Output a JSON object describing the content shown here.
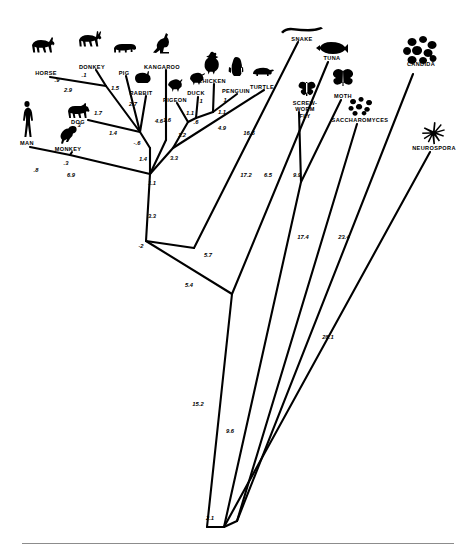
{
  "figure": {
    "type": "phylogenetic-tree"
  },
  "taxa": [
    {
      "name": "HORSE",
      "label": "HORSE",
      "icon": "horse-icon",
      "lx": 46,
      "ly": 70,
      "gx": 46,
      "gy": 36
    },
    {
      "name": "DONKEY",
      "label": "DONKEY",
      "icon": "donkey-icon",
      "lx": 92,
      "ly": 64,
      "gx": 92,
      "gy": 31
    },
    {
      "name": "PIG",
      "label": "PIG",
      "icon": "pig-icon",
      "lx": 124,
      "ly": 70,
      "gx": 125,
      "gy": 42
    },
    {
      "name": "KANGAROO",
      "label": "KANGAROO",
      "icon": "kangaroo-icon",
      "lx": 162,
      "ly": 64,
      "gx": 163,
      "gy": 32
    },
    {
      "name": "RABBIT",
      "label": "RABBIT",
      "icon": "rabbit-icon",
      "lx": 141,
      "ly": 90,
      "gx": 142,
      "gy": 70
    },
    {
      "name": "PIGEON",
      "label": "PIGEON",
      "icon": "pigeon-icon",
      "lx": 175,
      "ly": 97,
      "gx": 175,
      "gy": 78
    },
    {
      "name": "DUCK",
      "label": "DUCK",
      "icon": "duck-icon",
      "lx": 196,
      "ly": 90,
      "gx": 197,
      "gy": 71
    },
    {
      "name": "CHICKEN",
      "label": "CHICKEN",
      "icon": "chicken-icon",
      "lx": 212,
      "ly": 78,
      "gx": 212,
      "gy": 51
    },
    {
      "name": "PENGUIN",
      "label": "PENGUIN",
      "icon": "penguin-icon",
      "lx": 236,
      "ly": 88,
      "gx": 236,
      "gy": 56
    },
    {
      "name": "TURTLE",
      "label": "TURTLE",
      "icon": "turtle-icon",
      "lx": 262,
      "ly": 84,
      "gx": 262,
      "gy": 66
    },
    {
      "name": "SNAKE",
      "label": "SNAKE",
      "icon": "snake-icon",
      "lx": 302,
      "ly": 36,
      "gx": 302,
      "gy": 26
    },
    {
      "name": "TUNA",
      "label": "TUNA",
      "icon": "tuna-icon",
      "lx": 332,
      "ly": 55,
      "gx": 332,
      "gy": 40
    },
    {
      "name": "MOTH",
      "label": "MOTH",
      "icon": "moth-icon",
      "lx": 343,
      "ly": 93,
      "gx": 343,
      "gy": 68
    },
    {
      "name": "CANDIDA",
      "label": "CANDIDA",
      "icon": "candida-icon",
      "lx": 421,
      "ly": 61,
      "gx": 421,
      "gy": 35
    },
    {
      "name": "SCREW-WORM FLY",
      "label": "SCREW-\nWORM\nFLY",
      "icon": "screwworm-fly-icon",
      "lx": 305,
      "ly": 100,
      "gx": 307,
      "gy": 81
    },
    {
      "name": "SACCHAROMYCES",
      "label": "SACCHAROMYCES",
      "icon": "saccharomyces-icon",
      "lx": 360,
      "ly": 117,
      "gx": 362,
      "gy": 96
    },
    {
      "name": "NEUROSPORA",
      "label": "NEUROSPORA",
      "icon": "neurospora-icon",
      "lx": 434,
      "ly": 145,
      "gx": 434,
      "gy": 120
    },
    {
      "name": "MAN",
      "label": "MAN",
      "icon": "man-icon",
      "lx": 27,
      "ly": 140,
      "gx": 27,
      "gy": 100
    },
    {
      "name": "MONKEY",
      "label": "MONKEY",
      "icon": "monkey-icon",
      "lx": 68,
      "ly": 146,
      "gx": 68,
      "gy": 124
    },
    {
      "name": "DOG",
      "label": "DOG",
      "icon": "dog-icon",
      "lx": 78,
      "ly": 119,
      "gx": 79,
      "gy": 102
    }
  ],
  "branch_values": [
    {
      "value": ".9",
      "x": 57,
      "y": 80
    },
    {
      "value": ".1",
      "x": 84,
      "y": 75
    },
    {
      "value": "1.5",
      "x": 115,
      "y": 88
    },
    {
      "value": "2.9",
      "x": 68,
      "y": 90
    },
    {
      "value": "1.7",
      "x": 98,
      "y": 113
    },
    {
      "value": "3",
      "x": 79,
      "y": 125
    },
    {
      "value": "2.7",
      "x": 133,
      "y": 104
    },
    {
      "value": "1.4",
      "x": 113,
      "y": 133
    },
    {
      "value": "-.6",
      "x": 137,
      "y": 143
    },
    {
      "value": "4.6",
      "x": 159,
      "y": 121
    },
    {
      "value": ".8",
      "x": 36,
      "y": 170
    },
    {
      "value": ".3",
      "x": 66,
      "y": 163
    },
    {
      "value": "6.9",
      "x": 71,
      "y": 175
    },
    {
      "value": "1.4",
      "x": 143,
      "y": 159
    },
    {
      "value": "3.3",
      "x": 174,
      "y": 158
    },
    {
      "value": "1.1",
      "x": 152,
      "y": 183
    },
    {
      "value": "3.3",
      "x": 152,
      "y": 216
    },
    {
      "value": "-2",
      "x": 141,
      "y": 246
    },
    {
      "value": "1.6",
      "x": 167,
      "y": 120
    },
    {
      "value": "1.2",
      "x": 182,
      "y": 135
    },
    {
      "value": "1.1",
      "x": 190,
      "y": 113
    },
    {
      "value": ".6",
      "x": 196,
      "y": 122
    },
    {
      "value": "1",
      "x": 201,
      "y": 101
    },
    {
      "value": "1.1",
      "x": 222,
      "y": 112
    },
    {
      "value": "1",
      "x": 225,
      "y": 100
    },
    {
      "value": "4.9",
      "x": 222,
      "y": 128
    },
    {
      "value": "16.5",
      "x": 249,
      "y": 133
    },
    {
      "value": "17.2",
      "x": 246,
      "y": 175
    },
    {
      "value": "6.5",
      "x": 268,
      "y": 175
    },
    {
      "value": "9.9",
      "x": 297,
      "y": 175
    },
    {
      "value": "5.7",
      "x": 208,
      "y": 255
    },
    {
      "value": "5.4",
      "x": 189,
      "y": 285
    },
    {
      "value": "17.4",
      "x": 303,
      "y": 237
    },
    {
      "value": "23.4",
      "x": 344,
      "y": 237
    },
    {
      "value": "28.1",
      "x": 328,
      "y": 337
    },
    {
      "value": "15.2",
      "x": 198,
      "y": 404
    },
    {
      "value": "9.6",
      "x": 230,
      "y": 431
    },
    {
      "value": "2.1",
      "x": 210,
      "y": 518
    }
  ],
  "tree_edges": [
    {
      "from": "HORSE",
      "path": "M 50 77  L 106 86"
    },
    {
      "from": "DONKEY",
      "path": "M 96 70  L 106 86"
    },
    {
      "from": "horse-node",
      "path": "M 106 86 L 140 132"
    },
    {
      "from": "PIG",
      "path": "M 126 76 L 140 132"
    },
    {
      "from": "KANGAROO",
      "path": "M 166 70 L 166 140"
    },
    {
      "from": "RABBIT",
      "path": "M 146 96 L 140 132"
    },
    {
      "from": "DOG",
      "path": "M 88 120 L 140 132"
    },
    {
      "from": "mammal-node",
      "path": "M 140 132 L 150 148"
    },
    {
      "from": "MAN",
      "path": "M 30 147 L 70 155"
    },
    {
      "from": "MONKEY",
      "path": "M 72 152 L 70 155"
    },
    {
      "from": "primate-node",
      "path": "M 70 155 L 150 174"
    },
    {
      "from": "amniote",
      "path": "M 150 148 L 150 174"
    },
    {
      "from": "kangaroo-br",
      "path": "M 166 140 L 150 174"
    },
    {
      "from": "vertebrate",
      "path": "M 150 174 L 146 241"
    },
    {
      "from": "PIGEON",
      "path": "M 177 103 L 188 122"
    },
    {
      "from": "DUCK",
      "path": "M 198 97 L 196 118"
    },
    {
      "from": "CHICKEN",
      "path": "M 214 84 L 213 112"
    },
    {
      "from": "PENGUIN",
      "path": "M 237 94 L 213 112"
    },
    {
      "from": "bird-node-1",
      "path": "M 196 118 L 188 122"
    },
    {
      "from": "bird-node-2",
      "path": "M 213 112 L 196 118"
    },
    {
      "from": "bird-root",
      "path": "M 188 122 L 173 148"
    },
    {
      "from": "bird-stem",
      "path": "M 173 148 L 150 174"
    },
    {
      "from": "TURTLE",
      "path": "M 264 90 L 173 148"
    },
    {
      "from": "SNAKE",
      "path": "M 298 42 L 194 248"
    },
    {
      "from": "reptile-node",
      "path": "M 194 248 L 146 241"
    },
    {
      "from": "TUNA",
      "path": "M 328 62 L 232 294"
    },
    {
      "from": "deep-node",
      "path": "M 146 241 L 232 294"
    },
    {
      "from": "MOTH",
      "path": "M 341 100 L 301 182"
    },
    {
      "from": "SCREWWORM",
      "path": "M 299 112 L 301 182"
    },
    {
      "from": "insect-node",
      "path": "M 301 182 L 224 527"
    },
    {
      "from": "euk-stem",
      "path": "M 232 294 L 207 527"
    },
    {
      "from": "SACCHARO",
      "path": "M 357 124 L 237 521"
    },
    {
      "from": "CANDIDA",
      "path": "M 413 74 L 237 521"
    },
    {
      "from": "NEUROSPORA",
      "path": "M 430 152 L 224 527"
    },
    {
      "from": "root-join",
      "path": "M 224 527 L 207 527"
    },
    {
      "from": "fungi-join",
      "path": "M 237 521 L 224 527"
    }
  ],
  "divider": {
    "name": "bottom-rule"
  }
}
